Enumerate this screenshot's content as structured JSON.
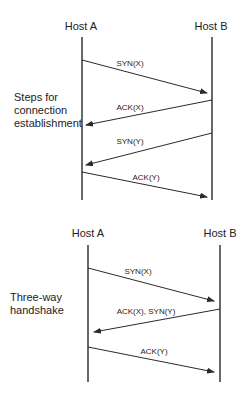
{
  "diagrams": [
    {
      "name": "connection-establishment",
      "host_a": "Host A",
      "host_b": "Host B",
      "side_label": [
        "Steps for",
        "connection",
        "establishment"
      ],
      "messages": [
        {
          "label": "SYN(X)",
          "direction": "A->B"
        },
        {
          "label": "ACK(X)",
          "direction": "B->A"
        },
        {
          "label": "SYN(Y)",
          "direction": "B->A"
        },
        {
          "label": "ACK(Y)",
          "direction": "A->B"
        }
      ]
    },
    {
      "name": "three-way-handshake",
      "host_a": "Host A",
      "host_b": "Host B",
      "side_label": [
        "Three-way",
        "handshake"
      ],
      "messages": [
        {
          "label": "SYN(X)",
          "direction": "A->B"
        },
        {
          "label": "ACK(X), SYN(Y)",
          "direction": "B->A"
        },
        {
          "label": "ACK(Y)",
          "direction": "A->B"
        }
      ]
    }
  ]
}
